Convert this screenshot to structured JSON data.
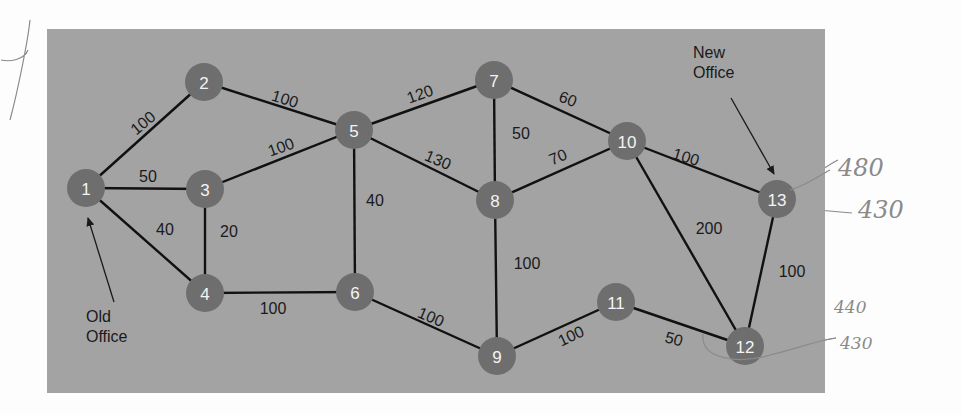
{
  "diagram": {
    "panel": {
      "x": 47,
      "y": 29,
      "width": 778,
      "height": 364,
      "color": "#a3a3a3"
    },
    "node_color": "#6e6e6e",
    "node_radius": 19,
    "nodes": [
      {
        "id": "1",
        "label": "1",
        "x": 86,
        "y": 188
      },
      {
        "id": "2",
        "label": "2",
        "x": 204,
        "y": 82
      },
      {
        "id": "3",
        "label": "3",
        "x": 205,
        "y": 189
      },
      {
        "id": "4",
        "label": "4",
        "x": 205,
        "y": 293
      },
      {
        "id": "5",
        "label": "5",
        "x": 354,
        "y": 130
      },
      {
        "id": "6",
        "label": "6",
        "x": 355,
        "y": 292
      },
      {
        "id": "7",
        "label": "7",
        "x": 494,
        "y": 80
      },
      {
        "id": "8",
        "label": "8",
        "x": 495,
        "y": 200
      },
      {
        "id": "9",
        "label": "9",
        "x": 497,
        "y": 356
      },
      {
        "id": "10",
        "label": "10",
        "x": 627,
        "y": 141
      },
      {
        "id": "11",
        "label": "11",
        "x": 616,
        "y": 302
      },
      {
        "id": "12",
        "label": "12",
        "x": 745,
        "y": 346
      },
      {
        "id": "13",
        "label": "13",
        "x": 777,
        "y": 199
      }
    ],
    "edges": [
      {
        "from": "1",
        "to": "2",
        "weight": "100",
        "lx": 143,
        "ly": 123,
        "rot": -40
      },
      {
        "from": "1",
        "to": "3",
        "weight": "50",
        "lx": 148,
        "ly": 176,
        "rot": 0
      },
      {
        "from": "1",
        "to": "4",
        "weight": "40",
        "lx": 165,
        "ly": 229,
        "rot": 0
      },
      {
        "from": "2",
        "to": "5",
        "weight": "100",
        "lx": 285,
        "ly": 99,
        "rot": 17
      },
      {
        "from": "3",
        "to": "5",
        "weight": "100",
        "lx": 281,
        "ly": 147,
        "rot": -20
      },
      {
        "from": "3",
        "to": "4",
        "weight": "20",
        "lx": 229,
        "ly": 231,
        "rot": 0
      },
      {
        "from": "4",
        "to": "6",
        "weight": "100",
        "lx": 273,
        "ly": 308,
        "rot": 0
      },
      {
        "from": "5",
        "to": "6",
        "weight": "40",
        "lx": 375,
        "ly": 200,
        "rot": 0
      },
      {
        "from": "5",
        "to": "7",
        "weight": "120",
        "lx": 420,
        "ly": 94,
        "rot": -20
      },
      {
        "from": "5",
        "to": "8",
        "weight": "130",
        "lx": 438,
        "ly": 160,
        "rot": 23
      },
      {
        "from": "7",
        "to": "8",
        "weight": "50",
        "lx": 521,
        "ly": 133,
        "rot": 0
      },
      {
        "from": "7",
        "to": "10",
        "weight": "60",
        "lx": 568,
        "ly": 99,
        "rot": 20
      },
      {
        "from": "8",
        "to": "10",
        "weight": "70",
        "lx": 558,
        "ly": 157,
        "rot": -22
      },
      {
        "from": "8",
        "to": "9",
        "weight": "100",
        "lx": 527,
        "ly": 263,
        "rot": 0
      },
      {
        "from": "6",
        "to": "9",
        "weight": "100",
        "lx": 431,
        "ly": 317,
        "rot": 23
      },
      {
        "from": "9",
        "to": "11",
        "weight": "100",
        "lx": 571,
        "ly": 336,
        "rot": -25
      },
      {
        "from": "10",
        "to": "13",
        "weight": "100",
        "lx": 686,
        "ly": 157,
        "rot": 17
      },
      {
        "from": "10",
        "to": "12",
        "weight": "200",
        "lx": 709,
        "ly": 228,
        "rot": 0
      },
      {
        "from": "11",
        "to": "12",
        "weight": "50",
        "lx": 674,
        "ly": 339,
        "rot": 15
      },
      {
        "from": "13",
        "to": "12",
        "weight": "100",
        "lx": 792,
        "ly": 271,
        "rot": 0
      }
    ],
    "callouts": [
      {
        "id": "old-office",
        "lines": [
          "Old",
          "Office"
        ],
        "x": 86,
        "y": 322,
        "arrow": {
          "x1": 114,
          "y1": 302,
          "x2": 88,
          "y2": 218
        }
      },
      {
        "id": "new-office",
        "lines": [
          "New",
          "Office"
        ],
        "x": 693,
        "y": 58,
        "arrow": {
          "x1": 731,
          "y1": 98,
          "x2": 774,
          "y2": 174
        }
      }
    ],
    "handwriting": {
      "scribble_mark": "X",
      "annotations": [
        {
          "text": "480",
          "x": 838,
          "y": 176,
          "size": "large"
        },
        {
          "text": "430",
          "x": 858,
          "y": 218,
          "size": "large"
        },
        {
          "text": "440",
          "x": 834,
          "y": 313,
          "size": "small"
        },
        {
          "text": "430",
          "x": 840,
          "y": 349,
          "size": "small"
        }
      ]
    }
  }
}
